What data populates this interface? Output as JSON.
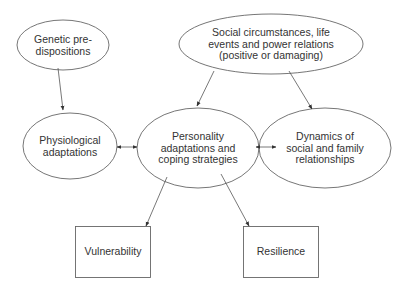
{
  "diagram": {
    "nodes": {
      "genetic": {
        "lines": [
          "Genetic pre-",
          "dispositions"
        ],
        "shape": "ellipse"
      },
      "social": {
        "lines": [
          "Social circumstances, life",
          "events and power relations",
          "(positive or damaging)"
        ],
        "shape": "ellipse"
      },
      "physiological": {
        "lines": [
          "Physiological",
          "adaptations"
        ],
        "shape": "ellipse"
      },
      "personality": {
        "lines": [
          "Personality",
          "adaptations and",
          "coping strategies"
        ],
        "shape": "ellipse"
      },
      "dynamics": {
        "lines": [
          "Dynamics of",
          "social and family",
          "relationships"
        ],
        "shape": "ellipse"
      },
      "vulnerability": {
        "lines": [
          "Vulnerability"
        ],
        "shape": "rectangle"
      },
      "resilience": {
        "lines": [
          "Resilience"
        ],
        "shape": "rectangle"
      }
    },
    "edges": [
      {
        "from": "genetic",
        "to": "physiological",
        "type": "directed"
      },
      {
        "from": "social",
        "to": "personality",
        "type": "directed"
      },
      {
        "from": "social",
        "to": "dynamics",
        "type": "directed"
      },
      {
        "from": "physiological",
        "to": "personality",
        "type": "bidirectional"
      },
      {
        "from": "personality",
        "to": "dynamics",
        "type": "bidirectional"
      },
      {
        "from": "personality",
        "to": "vulnerability",
        "type": "directed"
      },
      {
        "from": "personality",
        "to": "resilience",
        "type": "directed"
      }
    ],
    "colors": {
      "stroke": "#555555",
      "text": "#333333",
      "background": "#ffffff"
    }
  }
}
